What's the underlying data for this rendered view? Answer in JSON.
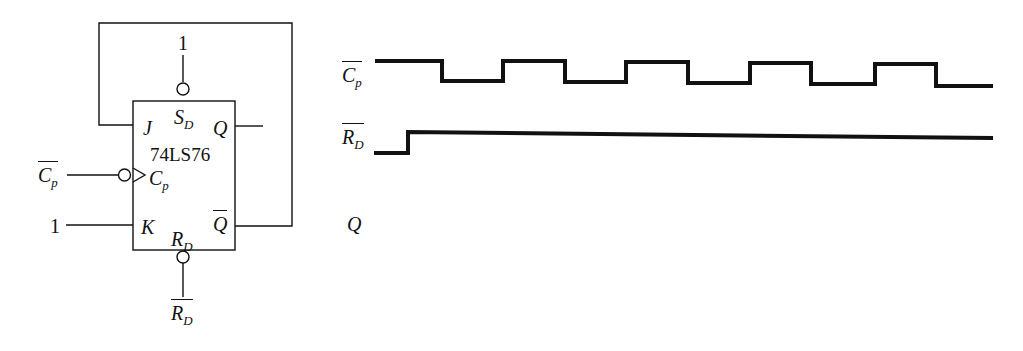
{
  "circuit": {
    "chip_name": "74LS76",
    "pins": {
      "J": "J",
      "K": "K",
      "Q": "Q",
      "Q_bar": "Q",
      "S_D": {
        "main": "S",
        "sub": "D"
      },
      "R_D": {
        "main": "R",
        "sub": "D"
      },
      "C_p": {
        "main": "C",
        "sub": "p"
      }
    },
    "inputs": {
      "S_D_level": "1",
      "K_level": "1",
      "clock_label": {
        "main": "C",
        "sub": "p"
      },
      "reset_label": {
        "main": "R",
        "sub": "D"
      }
    },
    "feedback": "Q-bar connected to J"
  },
  "timing": {
    "signals": [
      {
        "name": "C_p_bar",
        "label": {
          "main": "C",
          "sub": "p"
        },
        "overline": true
      },
      {
        "name": "R_D_bar",
        "label": {
          "main": "R",
          "sub": "D"
        },
        "overline": true
      },
      {
        "name": "Q",
        "label": {
          "main": "Q",
          "sub": ""
        },
        "overline": false
      }
    ],
    "clock_edges_x": [
      375,
      442,
      503,
      565,
      626,
      688,
      750,
      811,
      875,
      936,
      993
    ],
    "clock_levels": [
      "high",
      "low",
      "high",
      "low",
      "high",
      "low",
      "high",
      "low",
      "high",
      "low"
    ],
    "reset_edges_x": [
      374,
      408,
      993
    ],
    "reset_levels": [
      "low",
      "high"
    ],
    "q_waveform": "blank (to be drawn)"
  },
  "colors": {
    "ink": "#111111",
    "background": "#ffffff"
  }
}
